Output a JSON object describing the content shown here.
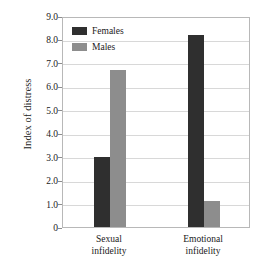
{
  "chart_data": {
    "type": "bar",
    "title": "",
    "subtitle": "",
    "xlabel": "",
    "ylabel": "Index of distress",
    "categories": [
      "Sexual infidelity",
      "Emotional infidelity"
    ],
    "category_lines": [
      [
        "Sexual",
        "infidelity"
      ],
      [
        "Emotional",
        "infidelity"
      ]
    ],
    "series": [
      {
        "name": "Females",
        "values": [
          3.0,
          8.2
        ],
        "color": "#2f2f2f"
      },
      {
        "name": "Males",
        "values": [
          6.7,
          1.1
        ],
        "color": "#8d8d8d"
      }
    ],
    "ylim": [
      0,
      9.0
    ],
    "ytick_values": [
      0,
      1.0,
      2.0,
      3.0,
      4.0,
      5.0,
      6.0,
      7.0,
      8.0,
      9.0
    ],
    "ytick_labels": [
      "0",
      "1.0",
      "2.0",
      "3.0",
      "4.0",
      "5.0",
      "6.0",
      "7.0",
      "8.0",
      "9.0"
    ],
    "grid": true,
    "grid_axis": "y",
    "legend_position": "top-left-inside",
    "bar_grouping": "adjacent"
  },
  "legend": {
    "entries": [
      {
        "label": "Females",
        "color": "#2f2f2f"
      },
      {
        "label": "Males",
        "color": "#8d8d8d"
      }
    ]
  },
  "axes": {
    "y_title": "Index of distress",
    "y_ticks": [
      "9.0",
      "8.0",
      "7.0",
      "6.0",
      "5.0",
      "4.0",
      "3.0",
      "2.0",
      "1.0",
      "0"
    ],
    "x_categories": [
      {
        "line1": "Sexual",
        "line2": "infidelity"
      },
      {
        "line1": "Emotional",
        "line2": "infidelity"
      }
    ]
  },
  "colors": {
    "females": "#2f2f2f",
    "males": "#8d8d8d",
    "gridline": "#d8d8d8",
    "frame": "#b8b8b8",
    "background": "#ffffff",
    "text": "#1a1a1a"
  }
}
